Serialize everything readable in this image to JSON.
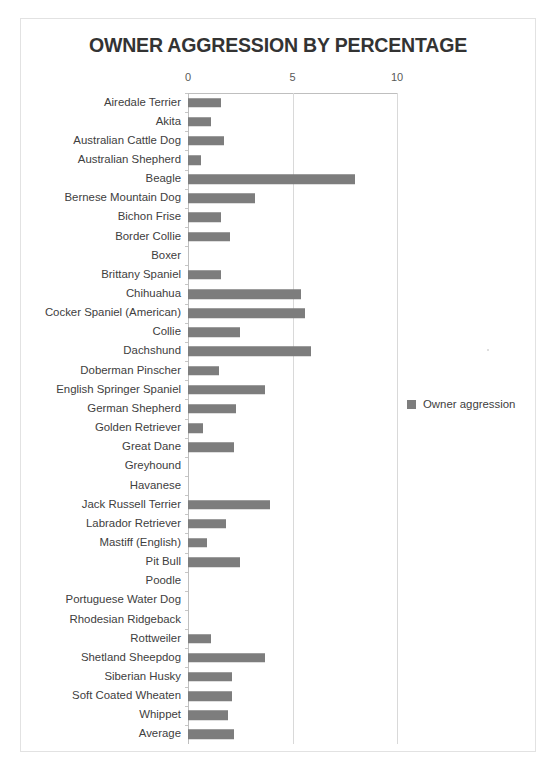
{
  "chart_data": {
    "type": "bar",
    "orientation": "horizontal",
    "title": "OWNER AGGRESSION BY PERCENTAGE",
    "xlabel": "",
    "ylabel": "",
    "xlim": [
      0,
      10
    ],
    "xticks": [
      "0",
      "5",
      "10"
    ],
    "xtick_values": [
      0,
      5,
      10
    ],
    "grid": "vertical",
    "legend_position": "right",
    "series": [
      {
        "name": "Owner aggression",
        "color": "#7d7d7d",
        "values": [
          1.6,
          1.1,
          1.7,
          0.6,
          8.0,
          3.2,
          1.6,
          2.0,
          0.0,
          1.6,
          5.4,
          5.6,
          2.5,
          5.9,
          1.5,
          3.7,
          2.3,
          0.7,
          2.2,
          0.0,
          0.0,
          3.9,
          1.8,
          0.9,
          2.5,
          0.0,
          0.0,
          0.0,
          1.1,
          3.7,
          2.1,
          2.1,
          1.9,
          2.2
        ]
      }
    ],
    "categories": [
      "Airedale Terrier",
      "Akita",
      "Australian Cattle Dog",
      "Australian Shepherd",
      "Beagle",
      "Bernese Mountain Dog",
      "Bichon Frise",
      "Border Collie",
      "Boxer",
      "Brittany Spaniel",
      "Chihuahua",
      "Cocker Spaniel (American)",
      "Collie",
      "Dachshund",
      "Doberman Pinscher",
      "English Springer Spaniel",
      "German Shepherd",
      "Golden Retriever",
      "Great Dane",
      "Greyhound",
      "Havanese",
      "Jack Russell Terrier",
      "Labrador Retriever",
      "Mastiff (English)",
      "Pit Bull",
      "Poodle",
      "Portuguese Water Dog",
      "Rhodesian Ridgeback",
      "Rottweiler",
      "Shetland Sheepdog",
      "Siberian Husky",
      "Soft Coated Wheaten",
      "Whippet",
      "Average"
    ]
  },
  "legend": {
    "entries": [
      {
        "label": "Owner aggression",
        "color": "#7d7d7d"
      }
    ]
  },
  "colors": {
    "bar": "#7d7d7d",
    "gridline": "#d9d9d9",
    "axis": "#bfbfbf",
    "frame": "#e2e2e2",
    "text": "#404040",
    "title": "#333333"
  }
}
